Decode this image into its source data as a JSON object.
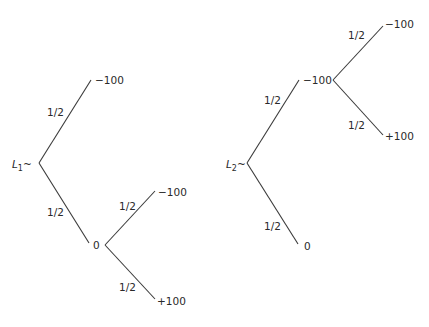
{
  "lottery1": {
    "label": "L",
    "subscript": "1",
    "tilde": "~",
    "branches": [
      {
        "prob": "1/2",
        "outcome": "−100"
      },
      {
        "prob": "1/2",
        "outcome": "0",
        "branches": [
          {
            "prob": "1/2",
            "outcome": "−100"
          },
          {
            "prob": "1/2",
            "outcome": "+100"
          }
        ]
      }
    ]
  },
  "lottery2": {
    "label": "L",
    "subscript": "2",
    "tilde": "~",
    "branches": [
      {
        "prob": "1/2",
        "outcome": "−100",
        "branches": [
          {
            "prob": "1/2",
            "outcome": "−100"
          },
          {
            "prob": "1/2",
            "outcome": "+100"
          }
        ]
      },
      {
        "prob": "1/2",
        "outcome": "0"
      }
    ]
  },
  "colors": {
    "line": "#3a3a3a",
    "text": "#2a2a2a",
    "background": "#ffffff"
  }
}
